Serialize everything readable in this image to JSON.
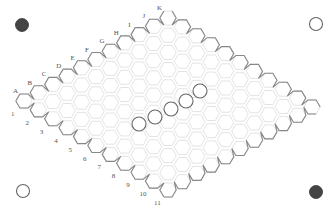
{
  "game": {
    "name": "Hex",
    "board_size": 11,
    "column_labels": [
      "A",
      "B",
      "C",
      "D",
      "E",
      "F",
      "G",
      "H",
      "I",
      "J",
      "K"
    ],
    "row_labels": [
      "1",
      "2",
      "3",
      "4",
      "5",
      "6",
      "7",
      "8",
      "9",
      "10",
      "11"
    ],
    "colors": {
      "cell_stroke": "#dcdcdc",
      "edge_stroke": "#888888",
      "black_stone": "#444444",
      "white_stone": "#ffffff",
      "label": "#555555"
    }
  },
  "geometry": {
    "origin": [
      24,
      101
    ],
    "letter_step": [
      14.4,
      -8.3
    ],
    "number_step": [
      14.4,
      8.9
    ],
    "hex_radius": 8.2
  },
  "corner_markers": [
    {
      "position": "top-left",
      "color": "black",
      "x": 22,
      "y": 25
    },
    {
      "position": "top-right",
      "color": "white",
      "x": 316,
      "y": 24
    },
    {
      "position": "bottom-left",
      "color": "white",
      "x": 23,
      "y": 191
    },
    {
      "position": "bottom-right",
      "color": "black",
      "x": 316,
      "y": 192
    }
  ],
  "stones": [
    {
      "color": "white",
      "x": 139,
      "y": 124
    },
    {
      "color": "white",
      "x": 155,
      "y": 117
    },
    {
      "color": "white",
      "x": 171,
      "y": 109
    },
    {
      "color": "white",
      "x": 186,
      "y": 101
    },
    {
      "color": "white",
      "x": 200,
      "y": 91
    }
  ]
}
